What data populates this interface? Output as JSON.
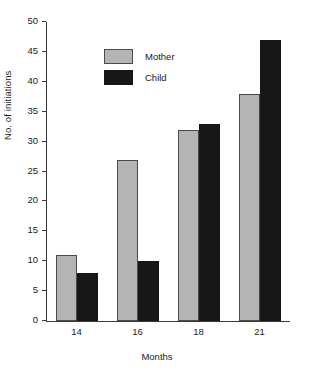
{
  "chart_data": {
    "type": "bar",
    "title": "",
    "subtitle": "",
    "xlabel": "Months",
    "ylabel": "No. of initiations",
    "categories": [
      "14",
      "16",
      "18",
      "21"
    ],
    "series": [
      {
        "name": "Mother",
        "color": "#b4b4b4",
        "values": [
          11,
          27,
          32,
          38
        ]
      },
      {
        "name": "Child",
        "color": "#171717",
        "values": [
          8,
          10,
          33,
          47
        ]
      }
    ],
    "ylim": [
      0,
      50
    ],
    "ytick_labels": [
      "0",
      "5",
      "10",
      "15",
      "20",
      "25",
      "30",
      "35",
      "40",
      "45",
      "50"
    ],
    "ytick_values": [
      0,
      5,
      10,
      15,
      20,
      25,
      30,
      35,
      40,
      45,
      50
    ],
    "grid": false,
    "legend_position": "top-left-inside",
    "axes_style": "L-shaped (left and bottom spines only)"
  },
  "legend": {
    "entries": [
      {
        "label": "Mother",
        "swatch": "mother-swatch"
      },
      {
        "label": "Child",
        "swatch": "child-swatch"
      }
    ]
  },
  "caption": {
    "sliver_text": ""
  }
}
